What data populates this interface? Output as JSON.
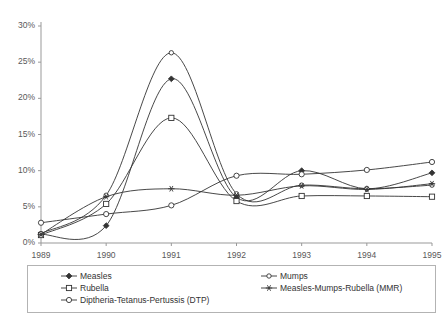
{
  "chart_data": {
    "type": "line",
    "title": "",
    "xlabel": "",
    "ylabel": "",
    "x": [
      1989,
      1990,
      1991,
      1992,
      1993,
      1994,
      1995
    ],
    "categories": [
      "1989",
      "1990",
      "1991",
      "1992",
      "1993",
      "1994",
      "1995"
    ],
    "xlim": [
      1989,
      1995
    ],
    "ylim": [
      0,
      30
    ],
    "ytick_values": [
      0,
      5,
      10,
      15,
      20,
      25,
      30
    ],
    "ytick_labels": [
      "0%",
      "5%",
      "10%",
      "15%",
      "20%",
      "25%",
      "30%"
    ],
    "xtick_labels": [
      "1989",
      "1990",
      "1991",
      "1992",
      "1993",
      "1994",
      "1995"
    ],
    "grid": false,
    "legend_position": "below-plot",
    "units": "percent",
    "series": [
      {
        "name": "Measles",
        "marker": "filled-diamond",
        "values": [
          1.2,
          2.4,
          22.7,
          6.3,
          10.0,
          7.5,
          9.7
        ]
      },
      {
        "name": "Rubella",
        "marker": "open-square",
        "values": [
          1.1,
          5.4,
          17.3,
          5.8,
          6.5,
          6.5,
          6.4
        ]
      },
      {
        "name": "Diptheria-Tetanus-Pertussis (DTP)",
        "marker": "open-circle",
        "values": [
          2.8,
          4.0,
          5.2,
          9.3,
          9.5,
          10.1,
          11.2
        ]
      },
      {
        "name": "Mumps",
        "marker": "open-circle-small",
        "values": [
          1.3,
          6.6,
          26.3,
          6.8,
          8.0,
          7.5,
          8.0
        ]
      },
      {
        "name": "Measles-Mumps-Rubella (MMR)",
        "marker": "asterisk",
        "values": [
          1.2,
          6.4,
          7.5,
          6.6,
          7.9,
          7.4,
          8.2
        ]
      }
    ]
  },
  "legend": {
    "items": [
      {
        "label": "Measles",
        "marker": "filled-diamond"
      },
      {
        "label": "Mumps",
        "marker": "open-circle-small"
      },
      {
        "label": "Rubella",
        "marker": "open-square"
      },
      {
        "label": "Measles-Mumps-Rubella (MMR)",
        "marker": "asterisk"
      },
      {
        "label": "Diptheria-Tetanus-Pertussis (DTP)",
        "marker": "open-circle"
      }
    ]
  },
  "colors": {
    "line": "#333333",
    "axis": "#999999",
    "tick_text": "#595959",
    "legend_border": "#b3b3b3",
    "background": "#ffffff"
  }
}
